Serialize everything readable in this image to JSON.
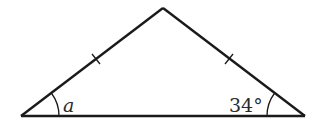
{
  "diagram": {
    "type": "isosceles-triangle",
    "stroke_color": "#1a1a1a",
    "vertices": {
      "left": [
        21,
        116
      ],
      "apex": [
        163,
        8
      ],
      "right": [
        305,
        116
      ]
    },
    "equal_side_marks": 2,
    "angles": {
      "left": {
        "label": "a",
        "italic": true
      },
      "right": {
        "label": "34°",
        "italic": false
      }
    }
  }
}
